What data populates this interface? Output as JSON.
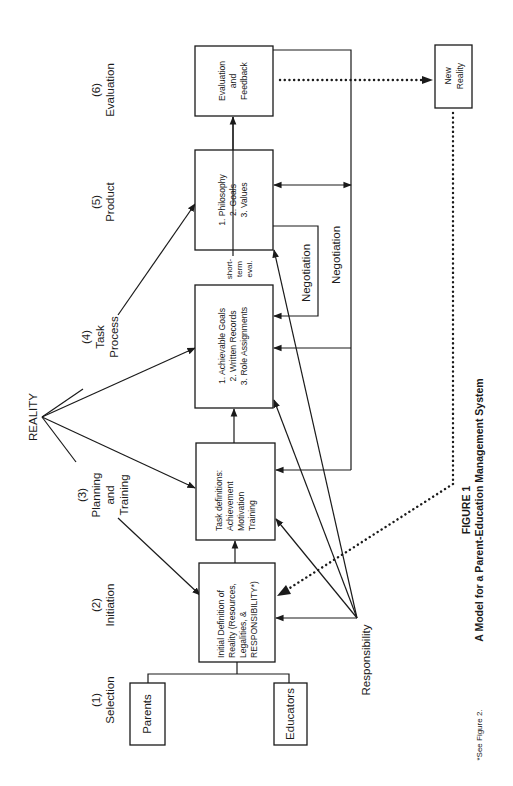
{
  "figure": {
    "number_label": "FIGURE 1",
    "title": "A Model for a Parent-Education Management System",
    "footnote": "*See Figure 2."
  },
  "stages": [
    {
      "num": "(1)",
      "lines": [
        "Selection"
      ]
    },
    {
      "num": "(2)",
      "lines": [
        "Initiation"
      ]
    },
    {
      "num": "(3)",
      "lines": [
        "Planning",
        "and",
        "Training"
      ]
    },
    {
      "num": "(4)",
      "lines": [
        "Task",
        "Process"
      ]
    },
    {
      "num": "(5)",
      "lines": [
        "Product"
      ]
    },
    {
      "num": "(6)",
      "lines": [
        "Evaluation"
      ]
    }
  ],
  "sources": {
    "reality": "REALITY",
    "responsibility": "Responsibility"
  },
  "boxes": {
    "parents": [
      "Parents"
    ],
    "educators": [
      "Educators"
    ],
    "initial_definition": [
      "Initial Definition of",
      "Reality (Resources,",
      "Legalities, &",
      "RESPONSIBILITY*)"
    ],
    "task_definitions": [
      "Task definitions:",
      "Achievement",
      "Motivation",
      "Training"
    ],
    "task_process": [
      "1.  Achievable Goals",
      "2.  Written Records",
      "3.  Role Assignments"
    ],
    "product": [
      "1.  Philosophy",
      "2.  Goals",
      "3.  Values"
    ],
    "evaluation": [
      "Evaluation",
      "and",
      "Feedback"
    ],
    "new_reality": [
      "New",
      "Reality"
    ]
  },
  "annotations": {
    "short_term_eval": [
      "short-",
      "term",
      "eval."
    ],
    "negotiation_inner": "Negotiation",
    "negotiation_outer": "Negotiation"
  }
}
